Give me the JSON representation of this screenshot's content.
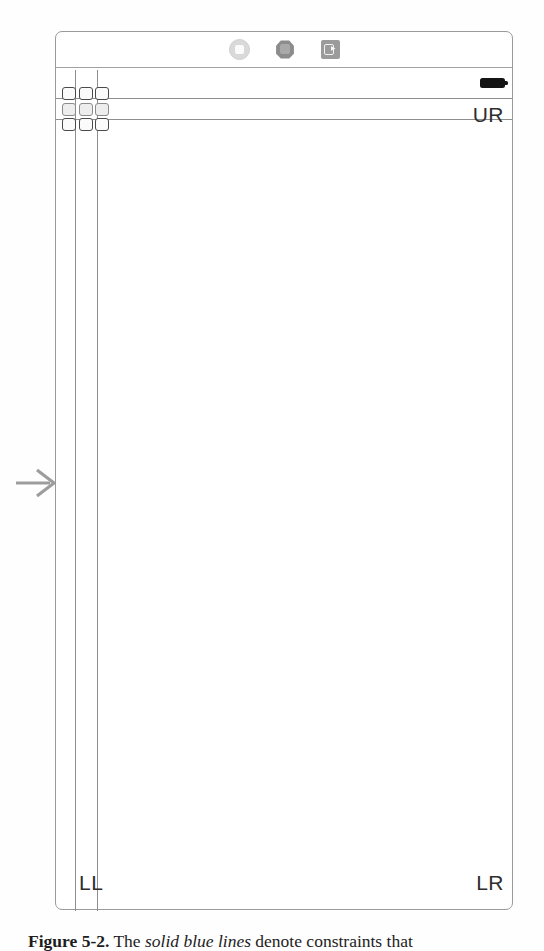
{
  "page": {
    "background_color": "#fdfdfd",
    "ink_color": "#2e2e2e"
  },
  "figure": {
    "frame": {
      "border_color": "#9a9a9a",
      "fill_color": "#ffffff"
    },
    "toolbar": {
      "divider_color": "#a2a2a2",
      "icons": [
        {
          "name": "ring-icon",
          "label": "ring"
        },
        {
          "name": "blob-icon",
          "label": "polygon"
        },
        {
          "name": "badge-icon",
          "label": "badge-arrow"
        }
      ]
    },
    "status": {
      "battery_label": "battery",
      "battery_color": "#141414"
    },
    "guides": {
      "rule_color": "#8e8e8e",
      "horizontal": [
        "upper",
        "lower"
      ],
      "vertical": [
        "outer",
        "inner"
      ]
    },
    "corner_labels": {
      "upper_right": "UR",
      "lower_right": "LR",
      "lower_left": "LL"
    },
    "widget_cluster": {
      "name": "handle-grid",
      "rows": 3,
      "columns": 3,
      "handle_border_color": "#4a4a4a"
    },
    "pointer": {
      "name": "arrow-right",
      "color": "#9d9d9d",
      "direction": "right"
    }
  },
  "caption": {
    "label": "Figure 5-2.",
    "emphasis": "solid blue lines",
    "text_before": " The ",
    "text_after": " denote constraints that"
  }
}
